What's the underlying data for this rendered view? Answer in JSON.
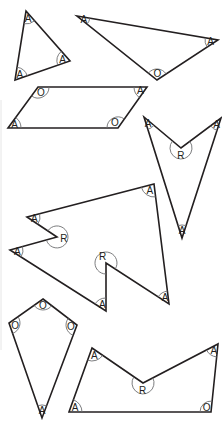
{
  "legend": {
    "A": "acute angle",
    "O": "obtuse angle",
    "R": "reflex angle"
  },
  "colors": {
    "outline": "#231f20",
    "arc": "#6d6e70",
    "background": "#ffffff"
  },
  "shapes": [
    {
      "name": "acute-triangle",
      "angles": [
        "A",
        "A",
        "A"
      ]
    },
    {
      "name": "obtuse-triangle",
      "angles": [
        "A",
        "A",
        "O"
      ]
    },
    {
      "name": "parallelogram",
      "angles": [
        "O",
        "A",
        "O",
        "A"
      ]
    },
    {
      "name": "arrowhead",
      "angles": [
        "A",
        "R",
        "A",
        "A"
      ]
    },
    {
      "name": "notched-hexagon",
      "angles": [
        "A",
        "A",
        "A",
        "R",
        "A",
        "A",
        "R"
      ]
    },
    {
      "name": "kite",
      "angles": [
        "O",
        "O",
        "A",
        "O"
      ]
    },
    {
      "name": "concave-pentagon",
      "angles": [
        "A",
        "R",
        "A",
        "O",
        "A"
      ]
    }
  ]
}
